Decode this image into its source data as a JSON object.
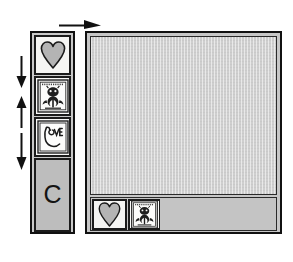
{
  "figure": {
    "background_color": "#ffffff"
  },
  "palette": {
    "name": "stamp-palette",
    "background_color": "#c9c9c9",
    "border_color": "#111111",
    "slots": [
      {
        "id": "heart",
        "icon": "heart-icon",
        "label": "Heart",
        "fill": "#b4b4b4",
        "stroke": "#1a1a1a"
      },
      {
        "id": "thistle",
        "icon": "thistle-crest-icon",
        "label": "Thistle crest",
        "fill": "#2a2a2a",
        "stroke": "#1a1a1a"
      },
      {
        "id": "love",
        "icon": "love-monogram-icon",
        "label": "LOVE monogram",
        "fill": "#1f1f1f",
        "stroke": "#1a1a1a"
      }
    ],
    "block": {
      "id": "c-block",
      "label": "C",
      "name": "c-block",
      "fill": "#bdbdbd"
    }
  },
  "arrows": {
    "top": {
      "name": "arrow-right",
      "direction": "right",
      "label": "move right",
      "color": "#111111"
    },
    "side": [
      {
        "name": "arrow-down-1",
        "direction": "down",
        "label": "move down",
        "color": "#111111"
      },
      {
        "name": "arrow-up-1",
        "direction": "up",
        "label": "move up",
        "color": "#111111"
      },
      {
        "name": "arrow-down-2",
        "direction": "down",
        "label": "move down",
        "color": "#111111"
      }
    ]
  },
  "canvas": {
    "name": "canvas-panel",
    "background_color": "#c7c7c7",
    "border_color": "#111111",
    "work_area": {
      "name": "canvas-work-area",
      "fill": "#cfcfcf",
      "label": "Work area"
    },
    "tray": {
      "name": "canvas-tray",
      "fill": "#c4c4c4",
      "label": "Placed stamps tray",
      "slots": [
        {
          "id": "heart",
          "icon": "heart-icon",
          "label": "Heart",
          "fill": "#b4b4b4",
          "stroke": "#1a1a1a"
        },
        {
          "id": "thistle",
          "icon": "thistle-crest-icon",
          "label": "Thistle crest",
          "fill": "#2a2a2a",
          "stroke": "#1a1a1a"
        }
      ],
      "empty_label": "Empty slot area"
    }
  }
}
